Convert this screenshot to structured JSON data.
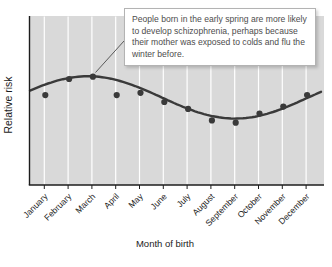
{
  "colors": {
    "plot_background": "#d9d9d9",
    "gridline": "#ffffff",
    "series": "#3a3a3a",
    "axis": "#1c1c1c",
    "callout_border": "#b3b3b3",
    "callout_text": "#4d4d4d"
  },
  "annotation": {
    "text": "People born in the early spring are more likely to develop schizophrenia, perhaps because their mother was exposed to colds and flu the winter before."
  },
  "chart_data": {
    "type": "scatter",
    "title": "",
    "xlabel": "Month of birth",
    "ylabel": "Relative risk",
    "categories": [
      "January",
      "February",
      "March",
      "April",
      "May",
      "June",
      "July",
      "August",
      "September",
      "October",
      "November",
      "December"
    ],
    "series": [
      {
        "name": "Relative risk of schizophrenia by birth month (y-axis unlabeled; values estimated, trend mean = 1.0)",
        "values": [
          1.02,
          1.09,
          1.1,
          1.02,
          1.03,
          0.99,
          0.96,
          0.91,
          0.9,
          0.94,
          0.97,
          1.02
        ]
      }
    ],
    "trend": {
      "type": "sine",
      "mean": 1.01,
      "amplitude": 0.092,
      "peak_month_index": 1.84,
      "period_months": 12.35,
      "note": "smooth fitted curve; peak between February and March, trough around September"
    },
    "y_axis": {
      "tick_labels": "none"
    },
    "grid": "vertical-only",
    "legend": "none"
  }
}
